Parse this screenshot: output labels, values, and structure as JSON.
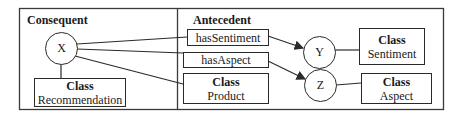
{
  "consequent": {
    "title": "Consequent",
    "node": "X",
    "class_box": {
      "label": "Class",
      "name": "Recommendation"
    }
  },
  "antecedent": {
    "title": "Antecedent",
    "properties": [
      {
        "label": "hasSentiment"
      },
      {
        "label": "hasAspect"
      }
    ],
    "product_box": {
      "label": "Class",
      "name": "Product"
    },
    "nodes": [
      {
        "id": "Y",
        "class_label": "Class",
        "class_name": "Sentiment"
      },
      {
        "id": "Z",
        "class_label": "Class",
        "class_name": "Aspect"
      }
    ]
  }
}
